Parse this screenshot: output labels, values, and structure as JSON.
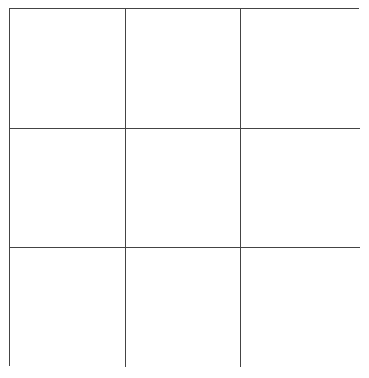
{
  "board": {
    "rows": 3,
    "cols": 3,
    "cells": [
      "",
      "",
      "",
      "",
      "",
      "",
      "",
      "",
      ""
    ],
    "line_color": "#444444",
    "background": "#ffffff"
  }
}
